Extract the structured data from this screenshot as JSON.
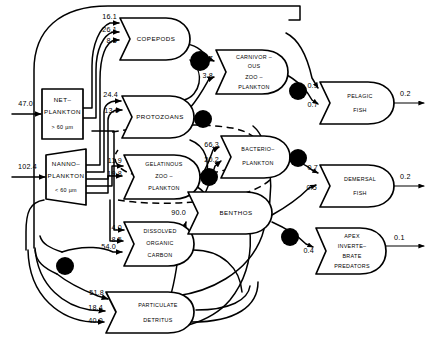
{
  "diagram": {
    "type": "ecosystem-energy-flow",
    "title": "",
    "units": "",
    "nodes": [
      {
        "id": "netplankton",
        "label_lines": [
          "NET–",
          "PLANKTON"
        ],
        "sublabel": "> 60 µm",
        "shape": "rectangle"
      },
      {
        "id": "nannoplankton",
        "label_lines": [
          "NANNO–",
          "PLANKTON"
        ],
        "sublabel": "< 60 µm",
        "shape": "tank"
      },
      {
        "id": "copepods",
        "label_lines": [
          "COPEPODS"
        ],
        "sublabel": "",
        "shape": "consumer"
      },
      {
        "id": "protozoans",
        "label_lines": [
          "PROTOZOANS"
        ],
        "sublabel": "",
        "shape": "consumer"
      },
      {
        "id": "gelatinous",
        "label_lines": [
          "GELATINOUS",
          "ZOO –",
          "PLANKTON"
        ],
        "sublabel": "",
        "shape": "consumer"
      },
      {
        "id": "doc",
        "label_lines": [
          "DISSOLVED",
          "ORGANIC",
          "CARBON"
        ],
        "sublabel": "",
        "shape": "consumer"
      },
      {
        "id": "detritus",
        "label_lines": [
          "PARTICULATE",
          "DETRITUS"
        ],
        "sublabel": "",
        "shape": "consumer"
      },
      {
        "id": "carnzoo",
        "label_lines": [
          "CARNIVOR –",
          "OUS",
          "ZOO –",
          "PLANKTON"
        ],
        "sublabel": "",
        "shape": "consumer"
      },
      {
        "id": "bacterio",
        "label_lines": [
          "BACTERIO–",
          "PLANKTON"
        ],
        "sublabel": "",
        "shape": "consumer"
      },
      {
        "id": "benthos",
        "label_lines": [
          "BENTHOS"
        ],
        "sublabel": "",
        "shape": "consumer"
      },
      {
        "id": "pelagicfish",
        "label_lines": [
          "PELAGIC",
          "FISH"
        ],
        "sublabel": "",
        "shape": "consumer"
      },
      {
        "id": "demersalfish",
        "label_lines": [
          "DEMERSAL",
          "FISH"
        ],
        "sublabel": "",
        "shape": "consumer"
      },
      {
        "id": "apex",
        "label_lines": [
          "APEX",
          "INVERTE–",
          "BRATE",
          "PREDATORS"
        ],
        "sublabel": "",
        "shape": "consumer"
      }
    ],
    "inputs": [
      {
        "id": "in-netplankton",
        "value": "47.0",
        "target": "netplankton"
      },
      {
        "id": "in-nannoplankton",
        "value": "102.4",
        "target": "nannoplankton"
      }
    ],
    "outputs": [
      {
        "id": "out-pelagicfish",
        "value": "0.2",
        "source": "pelagicfish"
      },
      {
        "id": "out-demersalfish",
        "value": "0.2",
        "source": "demersalfish"
      },
      {
        "id": "out-apex",
        "value": "0.1",
        "source": "apex"
      }
    ],
    "flows": [
      {
        "id": "f-copepods-1",
        "value": "16.1",
        "target": "copepods"
      },
      {
        "id": "f-copepods-2",
        "value": "26.1",
        "target": "copepods"
      },
      {
        "id": "f-copepods-3",
        "value": "8.5",
        "target": "copepods"
      },
      {
        "id": "f-protozoans-1",
        "value": "24.4",
        "target": "protozoans"
      },
      {
        "id": "f-protozoans-2",
        "value": "13.0",
        "target": "protozoans"
      },
      {
        "id": "f-gelatinous-1",
        "value": "11.9",
        "target": "gelatinous"
      },
      {
        "id": "f-gelatinous-2",
        "value": "19.8",
        "target": "gelatinous"
      },
      {
        "id": "f-doc-1",
        "value": "4.0",
        "target": "doc"
      },
      {
        "id": "f-doc-2",
        "value": "8.5",
        "target": "doc"
      },
      {
        "id": "f-doc-3",
        "value": "54.0",
        "target": "doc"
      },
      {
        "id": "f-detritus-1",
        "value": "51.8",
        "target": "detritus"
      },
      {
        "id": "f-detritus-2",
        "value": "18.4",
        "target": "detritus"
      },
      {
        "id": "f-detritus-3",
        "value": "40.0",
        "target": "detritus"
      },
      {
        "id": "f-carnzoo-1",
        "value": "8.7",
        "target": "carnzoo"
      },
      {
        "id": "f-carnzoo-2",
        "value": "3.8",
        "target": "carnzoo"
      },
      {
        "id": "f-bacterio-1",
        "value": "66.3",
        "target": "bacterio"
      },
      {
        "id": "f-bacterio-2",
        "value": "20.2",
        "target": "bacterio"
      },
      {
        "id": "f-benthos-1",
        "value": "90.0",
        "target": "benthos"
      },
      {
        "id": "f-pelagic-1",
        "value": "0.9",
        "target": "pelagicfish"
      },
      {
        "id": "f-pelagic-2",
        "value": "0.7",
        "target": "pelagicfish"
      },
      {
        "id": "f-demersal-1",
        "value": "0.7",
        "target": "demersalfish"
      },
      {
        "id": "f-demersal-2",
        "value": "0.5",
        "target": "demersalfish"
      },
      {
        "id": "f-apex-1",
        "value": "0.4",
        "target": "apex"
      }
    ],
    "colors": {
      "line": "#000000",
      "fill": "#ffffff",
      "sink": "#000000"
    }
  }
}
